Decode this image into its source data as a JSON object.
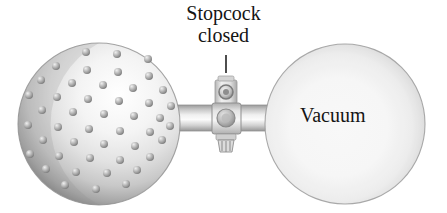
{
  "figure": {
    "type": "science-illustration",
    "background_color": "#ffffff"
  },
  "labels": {
    "stopcock_line1": "Stopcock",
    "stopcock_line2": "closed",
    "vacuum": "Vacuum"
  },
  "colors": {
    "text": "#141414",
    "glass_rim": "#8d8d8d",
    "glass_rim_dark": "#6f6f6f",
    "glass_light": "#ffffff",
    "glass_mid": "#d8d8d8",
    "particle": "#9a9a9a",
    "particle_highlight": "#e8e8e8",
    "valve_body": "#c9c9c9",
    "valve_dark": "#8a8a8a",
    "leader_line": "#3a3a3a"
  },
  "parts": {
    "left_bulb": {
      "name": "gas-filled bulb",
      "center_x": 99,
      "center_y": 124,
      "radius": 81,
      "contents": "gas particles",
      "particle_count": 45,
      "particle_radius": 4.0
    },
    "right_bulb": {
      "name": "evacuated bulb",
      "center_x": 345,
      "center_y": 124,
      "radius": 80,
      "contents": "vacuum",
      "particle_count": 0
    },
    "tube": {
      "name": "connecting tube",
      "x1": 168,
      "x2": 280,
      "center_y": 118,
      "height": 26
    },
    "stopcock": {
      "name": "stopcock valve",
      "state": "closed",
      "center_x": 226,
      "center_y": 118,
      "body_width": 26,
      "body_height": 30,
      "knob_height": 22,
      "plug_radius": 8
    },
    "leader": {
      "name": "label leader line",
      "x": 226,
      "y_top": 55,
      "y_bottom": 73
    }
  },
  "particles": {
    "positions": [
      [
        86,
        52
      ],
      [
        117,
        54
      ],
      [
        148,
        59
      ],
      [
        56,
        66
      ],
      [
        87,
        70
      ],
      [
        118,
        72
      ],
      [
        149,
        76
      ],
      [
        41,
        80
      ],
      [
        72,
        83
      ],
      [
        103,
        85
      ],
      [
        133,
        88
      ],
      [
        163,
        90
      ],
      [
        29,
        95
      ],
      [
        57,
        97
      ],
      [
        88,
        99
      ],
      [
        119,
        101
      ],
      [
        149,
        103
      ],
      [
        171,
        106
      ],
      [
        42,
        110
      ],
      [
        73,
        112
      ],
      [
        104,
        114
      ],
      [
        134,
        116
      ],
      [
        160,
        118
      ],
      [
        28,
        125
      ],
      [
        58,
        127
      ],
      [
        89,
        129
      ],
      [
        120,
        131
      ],
      [
        150,
        132
      ],
      [
        170,
        126
      ],
      [
        43,
        140
      ],
      [
        74,
        142
      ],
      [
        104,
        144
      ],
      [
        135,
        146
      ],
      [
        162,
        140
      ],
      [
        30,
        154
      ],
      [
        59,
        156
      ],
      [
        90,
        158
      ],
      [
        120,
        160
      ],
      [
        150,
        157
      ],
      [
        46,
        169
      ],
      [
        76,
        172
      ],
      [
        107,
        173
      ],
      [
        137,
        170
      ],
      [
        65,
        185
      ],
      [
        96,
        189
      ],
      [
        126,
        184
      ]
    ]
  }
}
